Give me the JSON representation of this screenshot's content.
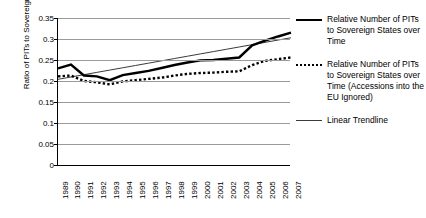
{
  "chart_data": {
    "type": "line",
    "title": "",
    "xlabel": "",
    "ylabel": "Ratio of PITs to Sovereign States",
    "ylim": [
      0,
      0.35
    ],
    "ytick_step": 0.05,
    "yticks": [
      "0",
      "0.05",
      "0.1",
      "0.15",
      "0.2",
      "0.25",
      "0.3",
      "0.35"
    ],
    "grid": true,
    "legend_position": "right",
    "categories": [
      "1989",
      "1990",
      "1991",
      "1992",
      "1993",
      "1994",
      "1995",
      "1996",
      "1997",
      "1998",
      "1999",
      "2000",
      "2001",
      "2002",
      "2003",
      "2004",
      "2005",
      "2006",
      "2007"
    ],
    "series": [
      {
        "name": "Relative Number of PITs to Sovereign States over Time",
        "style": "solid",
        "color": "#000000",
        "values": [
          0.23,
          0.239,
          0.213,
          0.211,
          0.202,
          0.214,
          0.219,
          0.224,
          0.231,
          0.238,
          0.244,
          0.249,
          0.25,
          0.253,
          0.256,
          0.285,
          0.296,
          0.306,
          0.315
        ]
      },
      {
        "name": "Relative Number of PITs to Sovereign States over Time (Accessions into the EU Ignored)",
        "style": "dotted",
        "color": "#000000",
        "values": [
          0.211,
          0.213,
          0.2,
          0.197,
          0.192,
          0.199,
          0.202,
          0.205,
          0.208,
          0.213,
          0.217,
          0.219,
          0.22,
          0.222,
          0.223,
          0.238,
          0.248,
          0.252,
          0.256
        ]
      },
      {
        "name": "Linear Trendline",
        "style": "thin",
        "color": "#3a3a3a",
        "values": [
          0.204,
          0.2095,
          0.215,
          0.2205,
          0.226,
          0.2315,
          0.237,
          0.2425,
          0.248,
          0.2535,
          0.259,
          0.2645,
          0.27,
          0.2755,
          0.281,
          0.2865,
          0.292,
          0.2975,
          0.303
        ]
      }
    ]
  },
  "legend": {
    "entries": [
      {
        "label": "Relative Number of PITs to Sovereign States over Time",
        "key": "solid-line-key"
      },
      {
        "label": "Relative Number of PITs to Sovereign States over Time (Accessions into the EU Ignored)",
        "key": "dotted-line-key"
      },
      {
        "label": "Linear Trendline",
        "key": "thin-line-key"
      }
    ]
  }
}
